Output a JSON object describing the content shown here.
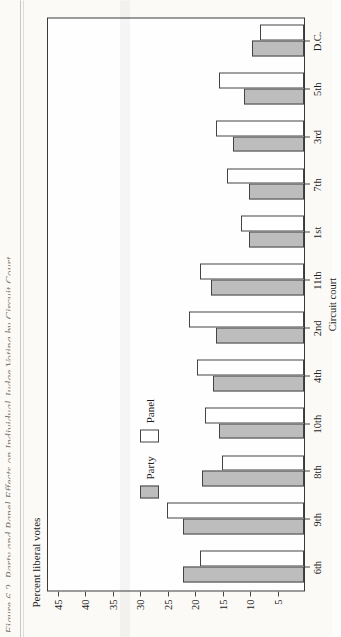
{
  "figure": {
    "caption": "Figure 6.2. Party and Panel Effects on Individual Judge  Voting by Circuit Court",
    "ylabel": "Percent liberal votes"
  },
  "legend": {
    "position": "inside-left",
    "items": [
      {
        "label": "Party",
        "swatch": "party",
        "color": "#bdbdbd"
      },
      {
        "label": "Panel",
        "swatch": "panel",
        "color": "#ffffff"
      }
    ]
  },
  "chart_data": {
    "type": "bar",
    "orientation": "vertical",
    "title": "Figure 6.2. Party and Panel Effects on Individual Judge  Voting by Circuit Court",
    "xlabel": "Circuit court",
    "ylabel": "Percent liberal votes",
    "ylim": [
      0,
      47
    ],
    "yticks": [
      5,
      10,
      15,
      20,
      25,
      30,
      35,
      40,
      45
    ],
    "grid": false,
    "categories": [
      "6th",
      "9th",
      "8th",
      "10th",
      "4th",
      "2nd",
      "11th",
      "1st",
      "7th",
      "3rd",
      "5th",
      "D.C."
    ],
    "series": [
      {
        "name": "Party",
        "color": "#bdbdbd",
        "values": [
          22.0,
          22.0,
          18.5,
          15.5,
          16.5,
          16.0,
          17.0,
          10.0,
          10.0,
          13.0,
          11.0,
          9.5
        ]
      },
      {
        "name": "Panel",
        "color": "#ffffff",
        "values": [
          19.0,
          25.0,
          15.0,
          18.0,
          19.5,
          21.0,
          19.0,
          11.5,
          14.0,
          16.0,
          15.5,
          8.0
        ]
      }
    ]
  }
}
